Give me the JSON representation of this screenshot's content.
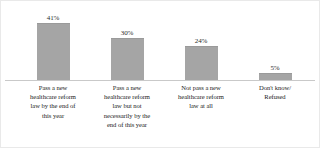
{
  "chart_data": {
    "type": "bar",
    "title": "",
    "subtitle": "",
    "xlabel": "",
    "ylabel": "",
    "grid": false,
    "legend": false,
    "ylim": [
      0,
      50
    ],
    "categories": [
      "Pass a new healthcare reform law by the end of this year",
      "Pass a new healthcare reform law but not necessarily by the end of this year",
      "Not pass a new healthcare reform law at all",
      "Don't know/ Refused"
    ],
    "values": [
      41,
      30,
      24,
      5
    ],
    "value_labels": [
      "41%",
      "30%",
      "24%",
      "5%"
    ],
    "bar_color": "#a5a5a5",
    "axis_color": "#c9c9c9",
    "text_color": "#222222"
  },
  "categories_wrapped": [
    "Pass a new\nhealthcare reform\nlaw by the end of\nthis year",
    "Pass a new\nhealthcare reform\nlaw but not\nnecessarily by the\nend of this year",
    "Not pass a new\nhealthcare reform\nlaw at all",
    "Don't know/\nRefused"
  ]
}
